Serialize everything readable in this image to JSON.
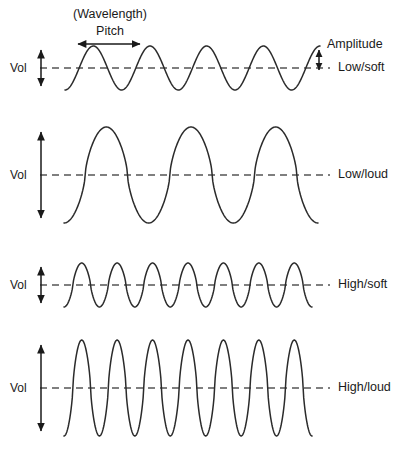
{
  "diagram": {
    "title_annotations": {
      "wavelength_label": "(Wavelength)",
      "pitch_label": "Pitch",
      "amplitude_label": "Amplitude"
    },
    "vol_label": "Vol",
    "line_color": "#2b2b2b",
    "baseline_color": "#555555",
    "text_color": "#1a1a1a",
    "background": "#ffffff"
  },
  "chart_data": {
    "type": "line",
    "title": "",
    "xlabel": "",
    "ylabel": "Vol",
    "grid": false,
    "legend": "right",
    "annotations": [
      {
        "name": "wavelength-pitch-arrow",
        "text": "(Wavelength) Pitch",
        "spans_one_cycle": true
      },
      {
        "name": "amplitude-arrow",
        "text": "Amplitude",
        "measures": "peak height from baseline"
      }
    ],
    "series": [
      {
        "name": "Low/soft",
        "pitch": "low",
        "volume": "soft",
        "cycles": 4.5,
        "amplitude": 22,
        "wavelength": 57,
        "x_start": 65,
        "x_end": 320,
        "baseline_y": 68
      },
      {
        "name": "Low/loud",
        "pitch": "low",
        "volume": "loud",
        "cycles": 3,
        "amplitude": 48,
        "wavelength": 82,
        "x_start": 64,
        "x_end": 318,
        "baseline_y": 175
      },
      {
        "name": "High/soft",
        "pitch": "high",
        "volume": "soft",
        "cycles": 7,
        "amplitude": 22,
        "wavelength": 35,
        "x_start": 64,
        "x_end": 312,
        "baseline_y": 285
      },
      {
        "name": "High/loud",
        "pitch": "high",
        "volume": "loud",
        "cycles": 7,
        "amplitude": 48,
        "wavelength": 35,
        "x_start": 64,
        "x_end": 312,
        "baseline_y": 388
      }
    ]
  },
  "rows": [
    {
      "label": "Low/soft",
      "vol": "Vol",
      "label_x": 338,
      "label_y": 68,
      "vol_y": 68,
      "arrow_half": 18
    },
    {
      "label": "Low/loud",
      "vol": "Vol",
      "label_x": 338,
      "label_y": 175,
      "vol_y": 175,
      "arrow_half": 43
    },
    {
      "label": "High/soft",
      "vol": "Vol",
      "label_x": 338,
      "label_y": 285,
      "vol_y": 285,
      "arrow_half": 18
    },
    {
      "label": "High/loud",
      "vol": "Vol",
      "label_x": 338,
      "label_y": 388,
      "vol_y": 388,
      "arrow_half": 43
    }
  ]
}
